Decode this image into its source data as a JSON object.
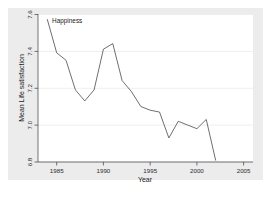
{
  "chart_data": {
    "type": "line",
    "title": "",
    "xlabel": "Year",
    "ylabel": "Mean Life satisfaction",
    "xlim": [
      1983,
      2006
    ],
    "ylim": [
      6.8,
      7.6
    ],
    "xticks": [
      1985,
      1990,
      1995,
      2000,
      2005
    ],
    "xtick_labels": [
      "1985",
      "1990",
      "1995",
      "2000",
      "2005"
    ],
    "yticks": [
      6.8,
      7.0,
      7.2,
      7.4,
      7.6
    ],
    "ytick_labels": [
      "6.8",
      "7.0",
      "7.2",
      "7.4",
      "7.6"
    ],
    "grid": true,
    "legend": "none",
    "series": [
      {
        "name": "Happiness",
        "label_position": "inline-start",
        "x": [
          1984,
          1985,
          1986,
          1987,
          1988,
          1989,
          1990,
          1991,
          1992,
          1993,
          1994,
          1995,
          1996,
          1997,
          1998,
          1999,
          2000,
          2001,
          2002
        ],
        "values": [
          7.57,
          7.39,
          7.35,
          7.19,
          7.13,
          7.19,
          7.41,
          7.44,
          7.24,
          7.18,
          7.1,
          7.08,
          7.07,
          6.93,
          7.02,
          7.0,
          6.98,
          7.03,
          6.81
        ]
      }
    ],
    "annotations": [
      {
        "text": "Happiness",
        "x": 1984.4,
        "y": 7.565
      }
    ],
    "colors": {
      "line": "#4a4a4a",
      "plot_background": "#ffffff",
      "figure_background": "#ececed",
      "grid": "#e3e3e5",
      "axis": "#3d3d3d",
      "text": "#1a1a1a"
    }
  }
}
